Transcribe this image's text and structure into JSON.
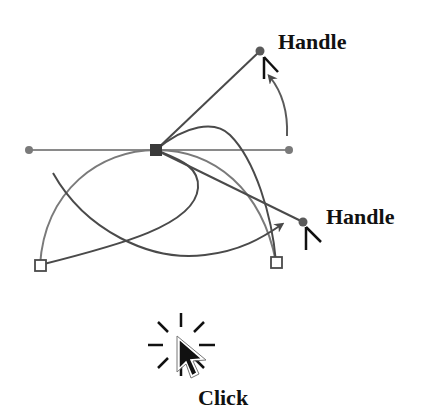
{
  "labels": {
    "handle_top": "Handle",
    "handle_right": "Handle",
    "click": "Click"
  },
  "colors": {
    "background": "#ffffff",
    "curve_dark": "#4a4a4a",
    "curve_light": "#7a7a7a",
    "handle_line": "#8a8a8a",
    "handle_dot": "#6a6a6a",
    "anchor_fill": "#3a3a3a",
    "text": "#111111"
  },
  "points": {
    "anchor_selected": {
      "x": 156,
      "y": 150
    },
    "handle_left": {
      "x": 29,
      "y": 150
    },
    "handle_right_horizontal": {
      "x": 289,
      "y": 150
    },
    "handle_top": {
      "x": 260,
      "y": 51
    },
    "handle_right": {
      "x": 303,
      "y": 222
    },
    "anchor_bottom_left": {
      "x": 40,
      "y": 265
    },
    "anchor_bottom_right": {
      "x": 276,
      "y": 262
    }
  },
  "icons": {
    "cursor": "arrow-cursor-icon",
    "click_burst": "click-burst-icon",
    "mini_cursor": "small-cursor-icon"
  }
}
